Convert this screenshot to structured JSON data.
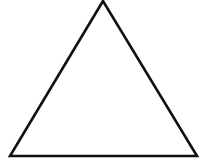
{
  "diagram": {
    "shape": "triangle",
    "type": "equilateral-like",
    "vertices": {
      "apex": [
        103,
        1
      ],
      "bottom_left": [
        10,
        156
      ],
      "bottom_right": [
        197,
        156
      ]
    },
    "stroke_color": "#111111",
    "stroke_width": 2.6,
    "fill_color": "#ffffff",
    "background_color": "#ffffff"
  }
}
